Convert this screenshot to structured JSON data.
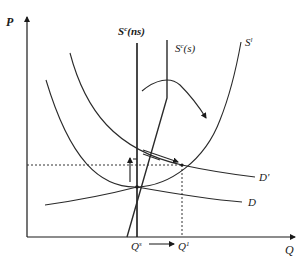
{
  "diagram": {
    "type": "economics supply-demand diagram",
    "axes": {
      "y_label": "P",
      "x_label": "Q"
    },
    "curves": {
      "short_run_supply_no_storage": {
        "label_main": "S",
        "label_sup": "c",
        "label_suffix": "(ns)"
      },
      "short_run_supply_storage": {
        "label_main": "S",
        "label_sup": "c",
        "label_suffix": "(s)"
      },
      "long_run_supply": {
        "label_main": "S",
        "label_sup": "l"
      },
      "demand_initial": {
        "label": "D"
      },
      "demand_shifted": {
        "label": "D'"
      }
    },
    "quantity_ticks": {
      "q_start": {
        "label_main": "Q",
        "label_sup": "s"
      },
      "q_end": {
        "label_main": "Q",
        "label_sup": "1"
      }
    },
    "annotations": {
      "price_rise_arrow": "upward arrow indicating price increase",
      "demand_shift_arrow": "arrow pointing to new equilibrium",
      "curved_arrow": "curved arrow from S^c(s) toward S^l",
      "quantity_arrow": "arrow from Q^s to Q^1"
    },
    "colors": {
      "ink": "#1a1a1a",
      "background": "#ffffff"
    }
  }
}
